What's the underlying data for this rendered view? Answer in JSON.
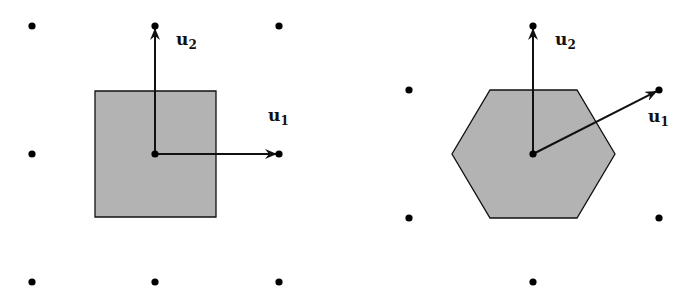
{
  "colors": {
    "background": "#ffffff",
    "cell_fill": "#b3b3b3",
    "stroke": "#111111",
    "point": "#000000"
  },
  "left_panel": {
    "title": "square lattice",
    "cell_shape": "square",
    "origin": [
      155,
      154
    ],
    "lattice_points": [
      [
        32,
        26
      ],
      [
        155,
        26
      ],
      [
        279,
        26
      ],
      [
        32,
        154
      ],
      [
        155,
        154
      ],
      [
        279,
        154
      ],
      [
        32,
        282
      ],
      [
        155,
        282
      ],
      [
        279,
        282
      ]
    ],
    "cell_polygon": "95,91 216,91 216,217 95,217",
    "vectors": [
      {
        "name": "u1",
        "label": "u",
        "subscript": "1",
        "to": [
          279,
          154
        ],
        "label_pos": [
          268,
          121
        ]
      },
      {
        "name": "u2",
        "label": "u",
        "subscript": "2",
        "to": [
          155,
          26
        ],
        "label_pos": [
          176,
          45
        ]
      }
    ]
  },
  "right_panel": {
    "title": "hexagonal lattice",
    "cell_shape": "hexagon",
    "origin": [
      533,
      154
    ],
    "lattice_points": [
      [
        533,
        26
      ],
      [
        409,
        90
      ],
      [
        659,
        90
      ],
      [
        409,
        218
      ],
      [
        659,
        218
      ],
      [
        533,
        154
      ],
      [
        533,
        282
      ]
    ],
    "cell_polygon": "490,90 577,90 615,154 577,218 490,218 452,154",
    "vectors": [
      {
        "name": "u1",
        "label": "u",
        "subscript": "1",
        "to": [
          659,
          90
        ],
        "label_pos": [
          648,
          122
        ]
      },
      {
        "name": "u2",
        "label": "u",
        "subscript": "2",
        "to": [
          533,
          26
        ],
        "label_pos": [
          555,
          45
        ]
      }
    ]
  }
}
